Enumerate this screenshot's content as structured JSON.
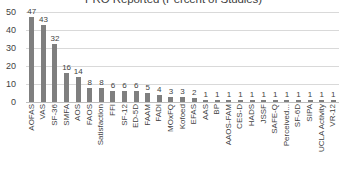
{
  "chart_data": {
    "type": "bar",
    "title": "PRO Reported (Percent of Studies)",
    "xlabel": "",
    "ylabel": "",
    "ylim": [
      0,
      50
    ],
    "yticks": [
      0,
      10,
      20,
      30,
      40,
      50
    ],
    "grid": true,
    "legend": false,
    "bar_color": "#7f7f7f",
    "categories": [
      "AOFAS",
      "VAS",
      "SF-36",
      "SMFA",
      "AOS",
      "FAOS",
      "Satisfaction",
      "FFI",
      "SF-12",
      "ED-5D",
      "FAAM",
      "FADI",
      "MOxFQ",
      "Kofoed",
      "EFAS",
      "AAS",
      "BP",
      "AAOS-FAM",
      "CES-D",
      "HADS",
      "JSSF",
      "SAFE-Q",
      "Perceived...",
      "SF-6D",
      "SIPA",
      "UCLA Activity",
      "VR-12"
    ],
    "values": [
      47,
      43,
      32,
      16,
      14,
      8,
      8,
      6,
      6,
      6,
      5,
      4,
      3,
      3,
      2,
      1,
      1,
      1,
      1,
      1,
      1,
      1,
      1,
      1,
      1,
      1,
      1
    ]
  }
}
